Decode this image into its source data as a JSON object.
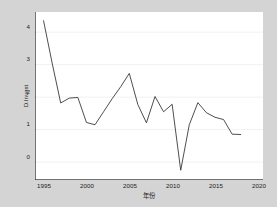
{
  "chart_data": {
    "type": "line",
    "title": "",
    "xlabel": "年份",
    "ylabel": "D.Invest",
    "xlim": [
      1994.0,
      2020.6
    ],
    "ylim": [
      -0.55,
      4.62
    ],
    "grid": true,
    "legend": "none",
    "xticks": [
      1995,
      2000,
      2005,
      2010,
      2015,
      2020
    ],
    "yticks": [
      0,
      1,
      2,
      3,
      4
    ],
    "xtick_labels": [
      "1995",
      "2000",
      "2005",
      "2010",
      "2015",
      "2020"
    ],
    "ytick_labels": [
      "0",
      "1",
      "2",
      "3",
      "4"
    ],
    "series": [
      {
        "name": "D.Invest",
        "x": [
          1995,
          1996,
          1997,
          1998,
          1999,
          2000,
          2001,
          2002,
          2003,
          2004,
          2005,
          2006,
          2007,
          2008,
          2009,
          2010,
          2011,
          2012,
          2013,
          2014,
          2015,
          2016,
          2017,
          2018
        ],
        "values": [
          4.35,
          3.05,
          1.82,
          1.97,
          1.99,
          1.22,
          1.15,
          1.55,
          1.95,
          2.32,
          2.73,
          1.77,
          1.21,
          2.02,
          1.55,
          1.78,
          -0.25,
          1.15,
          1.83,
          1.52,
          1.38,
          1.31,
          0.86,
          0.85
        ]
      }
    ]
  },
  "axes": {
    "xtick_labels": [
      "1995",
      "2000",
      "2005",
      "2010",
      "2015",
      "2020"
    ],
    "ytick_labels": [
      "4",
      "3",
      "2",
      "1",
      "0"
    ],
    "xlabel": "年份",
    "ylabel": "D.Invest"
  },
  "colors": {
    "figure_background": "#d4d4d4",
    "plot_background": "#ffffff",
    "line": "#2e2e2e",
    "grid": "#e9e9e9",
    "axis": "#3b3b3b",
    "text": "#222222"
  }
}
